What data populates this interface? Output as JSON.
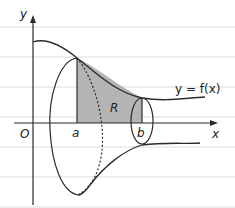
{
  "diagram": {
    "labels": {
      "y_axis": "y",
      "x_axis": "x",
      "origin": "O",
      "a": "a",
      "b": "b",
      "region": "R",
      "curve": "y = f(x)"
    },
    "colors": {
      "region_fill": "#b4b4b4",
      "stroke": "#2a2a2a",
      "ruled_lines": "#d8d8d8",
      "background": "#ffffff"
    }
  }
}
